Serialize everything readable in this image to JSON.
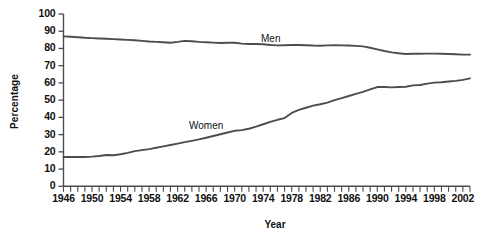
{
  "chart_data": {
    "type": "line",
    "title": "",
    "xlabel": "Year",
    "ylabel": "Percentage",
    "xlim": [
      1946,
      2003
    ],
    "ylim": [
      0,
      100
    ],
    "grid": false,
    "legend_position": "inline-labels",
    "y_ticks": [
      0,
      10,
      20,
      30,
      40,
      50,
      60,
      70,
      80,
      90,
      100
    ],
    "y_tick_labels": [
      "0",
      "10",
      "20",
      "30",
      "40",
      "50",
      "60",
      "70",
      "80",
      "90",
      "100"
    ],
    "x_tick_labels": [
      "1946",
      "1950",
      "1954",
      "1958",
      "1962",
      "1966",
      "1970",
      "1974",
      "1978",
      "1982",
      "1986",
      "1990",
      "1994",
      "1998",
      "2002"
    ],
    "x_tick_label_values": [
      1946,
      1950,
      1954,
      1958,
      1962,
      1966,
      1970,
      1974,
      1978,
      1982,
      1986,
      1990,
      1994,
      1998,
      2002
    ],
    "x_minor_ticks_every": 1,
    "x": [
      1946,
      1947,
      1948,
      1949,
      1950,
      1951,
      1952,
      1953,
      1954,
      1955,
      1956,
      1957,
      1958,
      1959,
      1960,
      1961,
      1962,
      1963,
      1964,
      1965,
      1966,
      1967,
      1968,
      1969,
      1970,
      1971,
      1972,
      1973,
      1974,
      1975,
      1976,
      1977,
      1978,
      1979,
      1980,
      1981,
      1982,
      1983,
      1984,
      1985,
      1986,
      1987,
      1988,
      1989,
      1990,
      1991,
      1992,
      1993,
      1994,
      1995,
      1996,
      1997,
      1998,
      1999,
      2000,
      2001,
      2002,
      2003
    ],
    "series": [
      {
        "name": "Men",
        "color": "#4d4d4d",
        "label_x": 1974,
        "label_y": 88,
        "values": [
          87,
          86.8,
          86.5,
          86.2,
          86,
          85.8,
          85.6,
          85.4,
          85.2,
          85,
          84.8,
          84.4,
          84,
          83.8,
          83.6,
          83.3,
          83.8,
          84.4,
          84.2,
          83.8,
          83.6,
          83.4,
          83.2,
          83.3,
          83.3,
          82.8,
          82.6,
          82.6,
          82.4,
          82,
          81.8,
          81.9,
          82,
          82,
          81.9,
          81.7,
          81.6,
          81.8,
          81.9,
          81.8,
          81.7,
          81.5,
          81.2,
          80.4,
          79.5,
          78.5,
          77.7,
          77.2,
          76.8,
          76.9,
          76.9,
          77,
          77,
          76.9,
          76.8,
          76.6,
          76.4,
          76.4
        ]
      },
      {
        "name": "Women",
        "color": "#4d4d4d",
        "label_x": 1960,
        "label_y": 36,
        "values": [
          17,
          17,
          17,
          17,
          17.2,
          17.6,
          18.2,
          18,
          18.6,
          19.4,
          20.4,
          21,
          21.6,
          22.4,
          23.2,
          24,
          24.8,
          25.6,
          26.4,
          27.2,
          28.2,
          29.2,
          30.2,
          31.2,
          32.2,
          32.6,
          33.4,
          34.6,
          36,
          37.4,
          38.6,
          39.6,
          42.6,
          44.4,
          45.6,
          46.8,
          47.6,
          48.6,
          50,
          51.2,
          52.4,
          53.6,
          54.8,
          56.2,
          57.6,
          57.6,
          57.4,
          57.6,
          57.8,
          58.6,
          58.8,
          59.6,
          60.2,
          60.4,
          60.8,
          61.2,
          61.8,
          62.6
        ]
      }
    ]
  },
  "axes": {
    "x_title": "Year",
    "y_title": "Percentage"
  }
}
